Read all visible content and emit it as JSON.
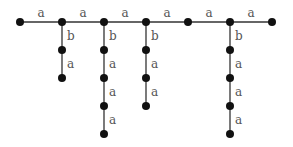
{
  "diagram": {
    "type": "tree",
    "colors": {
      "edge": "#333333",
      "node": "#111111",
      "label": "#555555"
    },
    "nodes": [
      {
        "id": "t0",
        "x": 20,
        "y": 22
      },
      {
        "id": "t1",
        "x": 62,
        "y": 22
      },
      {
        "id": "t2",
        "x": 104,
        "y": 22
      },
      {
        "id": "t3",
        "x": 146,
        "y": 22
      },
      {
        "id": "t4",
        "x": 188,
        "y": 22
      },
      {
        "id": "t5",
        "x": 230,
        "y": 22
      },
      {
        "id": "t6",
        "x": 272,
        "y": 22
      },
      {
        "id": "b1_1",
        "x": 62,
        "y": 50
      },
      {
        "id": "b1_2",
        "x": 62,
        "y": 78
      },
      {
        "id": "b2_1",
        "x": 104,
        "y": 50
      },
      {
        "id": "b2_2",
        "x": 104,
        "y": 78
      },
      {
        "id": "b2_3",
        "x": 104,
        "y": 106
      },
      {
        "id": "b2_4",
        "x": 104,
        "y": 134
      },
      {
        "id": "b3_1",
        "x": 146,
        "y": 50
      },
      {
        "id": "b3_2",
        "x": 146,
        "y": 78
      },
      {
        "id": "b3_3",
        "x": 146,
        "y": 106
      },
      {
        "id": "b5_1",
        "x": 230,
        "y": 50
      },
      {
        "id": "b5_2",
        "x": 230,
        "y": 78
      },
      {
        "id": "b5_3",
        "x": 230,
        "y": 106
      },
      {
        "id": "b5_4",
        "x": 230,
        "y": 134
      }
    ],
    "edges": [
      {
        "from": "t0",
        "to": "t1",
        "label": "a"
      },
      {
        "from": "t1",
        "to": "t2",
        "label": "a"
      },
      {
        "from": "t2",
        "to": "t3",
        "label": "a"
      },
      {
        "from": "t3",
        "to": "t4",
        "label": "a"
      },
      {
        "from": "t4",
        "to": "t5",
        "label": "a"
      },
      {
        "from": "t5",
        "to": "t6",
        "label": "a"
      },
      {
        "from": "t1",
        "to": "b1_1",
        "label": "b"
      },
      {
        "from": "b1_1",
        "to": "b1_2",
        "label": "a"
      },
      {
        "from": "t2",
        "to": "b2_1",
        "label": "b"
      },
      {
        "from": "b2_1",
        "to": "b2_2",
        "label": "a"
      },
      {
        "from": "b2_2",
        "to": "b2_3",
        "label": "a"
      },
      {
        "from": "b2_3",
        "to": "b2_4",
        "label": "a"
      },
      {
        "from": "t3",
        "to": "b3_1",
        "label": "b"
      },
      {
        "from": "b3_1",
        "to": "b3_2",
        "label": "a"
      },
      {
        "from": "b3_2",
        "to": "b3_3",
        "label": "a"
      },
      {
        "from": "t5",
        "to": "b5_1",
        "label": "b"
      },
      {
        "from": "b5_1",
        "to": "b5_2",
        "label": "a"
      },
      {
        "from": "b5_2",
        "to": "b5_3",
        "label": "a"
      },
      {
        "from": "b5_3",
        "to": "b5_4",
        "label": "a"
      }
    ]
  }
}
